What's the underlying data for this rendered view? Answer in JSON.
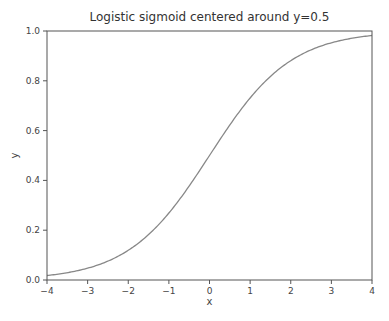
{
  "chart_data": {
    "type": "line",
    "title": "Logistic sigmoid centered around y=0.5",
    "xlabel": "x",
    "ylabel": "y",
    "xlim": [
      -4,
      4
    ],
    "ylim": [
      0.0,
      1.0
    ],
    "x_ticks": [
      "−4",
      "−3",
      "−2",
      "−1",
      "0",
      "1",
      "2",
      "3",
      "4"
    ],
    "y_ticks": [
      "0.0",
      "0.2",
      "0.4",
      "0.6",
      "0.8",
      "1.0"
    ],
    "grid": false,
    "legend": null,
    "series": [
      {
        "name": "sigmoid",
        "function": "1/(1+exp(-x))",
        "color": "#888888",
        "x": [
          -4,
          -3,
          -2,
          -1,
          0,
          1,
          2,
          3,
          4
        ],
        "y": [
          0.018,
          0.047,
          0.119,
          0.269,
          0.5,
          0.731,
          0.881,
          0.953,
          0.982
        ]
      }
    ]
  }
}
